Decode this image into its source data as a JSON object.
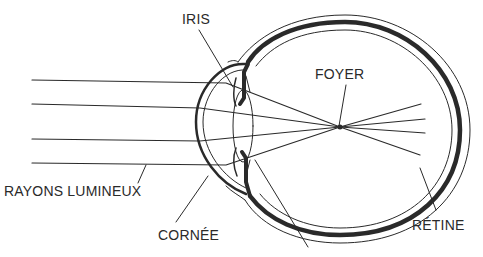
{
  "diagram": {
    "labels": {
      "iris": "IRIS",
      "foyer": "FOYER",
      "rayons": "RAYONS LUMINEUX",
      "cornee": "CORNÉE",
      "retine": "RÉTINE"
    },
    "colors": {
      "line": "#2a2a2a",
      "background": "#ffffff"
    }
  }
}
